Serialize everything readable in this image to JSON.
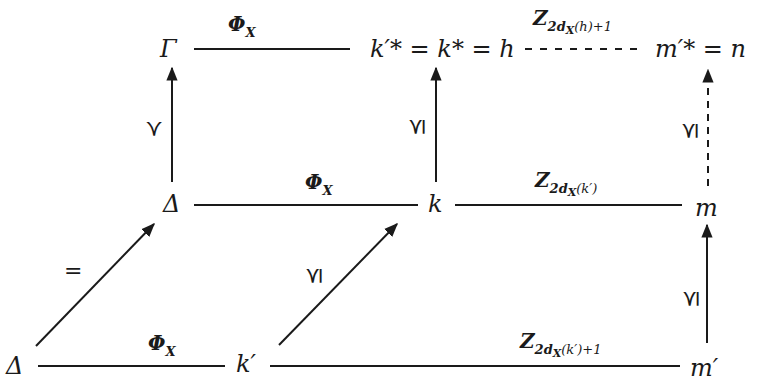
{
  "diagram": {
    "type": "commutative-diagram",
    "colors": {
      "ink": "#1a1a1a",
      "background": "#ffffff"
    },
    "nodes": {
      "gamma_top": "Γ",
      "top_middle": "k′* = k* = h",
      "top_right": "m′* = n",
      "delta_mid": "Δ",
      "k_mid": "k",
      "m_mid": "m",
      "delta_bottom": "Δ",
      "kprime_bottom": "k′",
      "mprime_bottom": "m′"
    },
    "edge_labels": {
      "top_left": "Φ",
      "top_left_sub": "X",
      "top_right_main": "Z",
      "top_right_sub": "2d",
      "top_right_sub2": "X",
      "top_right_sub3": "(h)+1",
      "mid_left": "Φ",
      "mid_left_sub": "X",
      "mid_right_main": "Z",
      "mid_right_sub": "2d",
      "mid_right_sub2": "X",
      "mid_right_sub3": "(k′)",
      "bottom_left": "Φ",
      "bottom_left_sub": "X",
      "bottom_right_main": "Z",
      "bottom_right_sub": "2d",
      "bottom_right_sub2": "X",
      "bottom_right_sub3": "(k′)+1",
      "vert_left": "≺",
      "vert_middle": "⪯",
      "vert_right_top": "⪯",
      "vert_right_bottom": "⪯",
      "diag_left": "=",
      "diag_middle": "⪯"
    },
    "edges": [
      {
        "from": "Γ",
        "to": "k′* = k* = h",
        "label": "Φ_X",
        "style": "solid"
      },
      {
        "from": "k′* = k* = h",
        "to": "m′* = n",
        "label": "Z_{2d_X(h)+1}",
        "style": "dashed"
      },
      {
        "from": "Δ",
        "to": "Γ",
        "label": "≺",
        "style": "solid-arrow"
      },
      {
        "from": "k",
        "to": "k′* = k* = h",
        "label": "⪯",
        "style": "solid-arrow"
      },
      {
        "from": "m",
        "to": "m′* = n",
        "label": "⪯",
        "style": "dashed-arrow"
      },
      {
        "from": "Δ",
        "to": "k",
        "label": "Φ_X",
        "style": "solid"
      },
      {
        "from": "k",
        "to": "m",
        "label": "Z_{2d_X(k′)}",
        "style": "solid"
      },
      {
        "from": "Δ (bottom)",
        "to": "Δ",
        "label": "=",
        "style": "solid-arrow"
      },
      {
        "from": "k′",
        "to": "k",
        "label": "⪯",
        "style": "solid-arrow"
      },
      {
        "from": "m′",
        "to": "m",
        "label": "⪯",
        "style": "solid-arrow"
      },
      {
        "from": "Δ (bottom)",
        "to": "k′",
        "label": "Φ_X",
        "style": "solid"
      },
      {
        "from": "k′",
        "to": "m′",
        "label": "Z_{2d_X(k′)+1}",
        "style": "solid"
      }
    ]
  }
}
